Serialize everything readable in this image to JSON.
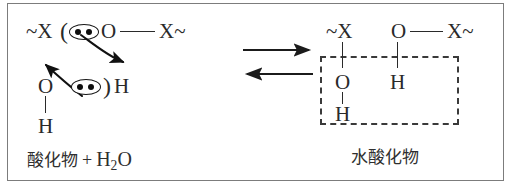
{
  "figure": {
    "background_color": "#ffffff",
    "border_color": "#7c7c7c",
    "ink_color": "#2a2a2a"
  },
  "reactant": {
    "chain_start": "~X",
    "open_paren": "(",
    "bridging_oxygen": "O",
    "chain_end": "X~",
    "water_oxygen": "O",
    "close_paren": ")",
    "water_hydrogen_right": "H",
    "water_hydrogen_bottom": "H",
    "lone_pair_count": 2,
    "lone_pair_dot_color": "#0d0d0d",
    "arrow_top_label": "electron-pair-attack-arrow",
    "arrow_bottom_label": "electron-pair-donation-arrow"
  },
  "equilibrium": {
    "forward_arrow": "forward-reaction-arrow",
    "reverse_arrow": "reverse-reaction-arrow"
  },
  "product": {
    "chain_start": "~X",
    "bridging_oxygen": "O",
    "chain_end": "X~",
    "hydroxyl_oxygen": "O",
    "hydroxyl_hydrogen": "H",
    "bound_hydrogen": "H",
    "highlight_box_color": "#3a3a3a",
    "highlight_box_style": "dashed"
  },
  "captions": {
    "left_compound": "酸化物",
    "left_plus": "+",
    "left_water_formula": "H",
    "left_water_subscript": "2",
    "left_water_suffix": "O",
    "right_compound": "水酸化物"
  }
}
